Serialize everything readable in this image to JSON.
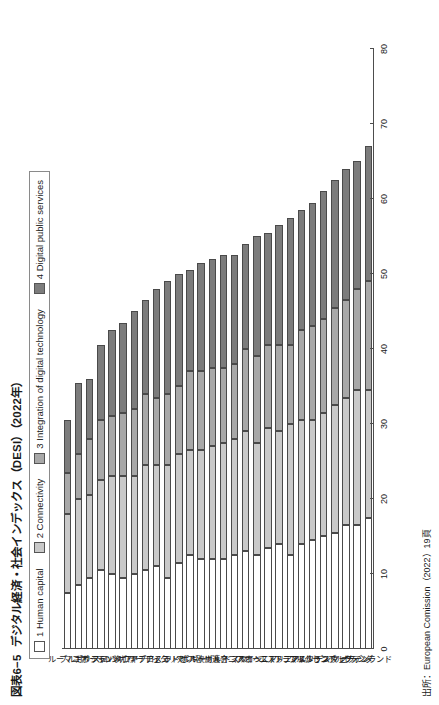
{
  "figure": {
    "title_number": "図表6−5",
    "title_text": "デジタル経済・社会インデックス（DESI）（2022年）",
    "source": "出所：European Comission（2022）19頁"
  },
  "legend": {
    "position": "top-left",
    "items": [
      {
        "label": "1 Human capital",
        "color": "#ffffff"
      },
      {
        "label": "2 Connectivity",
        "color": "#c9c9c9"
      },
      {
        "label": "3 Integration of digital technology",
        "color": "#a8a8a8"
      },
      {
        "label": "4 Digital public services",
        "color": "#7c7c7c"
      }
    ]
  },
  "chart_data": {
    "type": "bar",
    "orientation": "horizontal-stacked",
    "title": "デジタル経済・社会インデックス（DESI）（2022年）",
    "xlabel": "",
    "ylabel": "",
    "ylim": [
      0,
      80
    ],
    "ticks": [
      0,
      10,
      20,
      30,
      40,
      50,
      60,
      70,
      80
    ],
    "grid": false,
    "legend_position": "top-left",
    "categories": [
      "ルーマニア",
      "ブルガリア",
      "ギリシャ",
      "ポーランド",
      "スロバキア",
      "ハンガリー",
      "クロアチア",
      "キプロス",
      "チェコ",
      "イタリア",
      "ラトビア",
      "ベルギー",
      "ポルトガル",
      "欧州連合",
      "リトアニア",
      "ドイツ",
      "スペイン",
      "スロベニア",
      "オーストリア",
      "エストニア",
      "フランス",
      "マルタ",
      "アイルランド",
      "ルクセンブルク",
      "デンマーク",
      "スウェーデン",
      "オランダ",
      "フィンランド"
    ],
    "series": [
      {
        "name": "1 Human capital",
        "color": "#ffffff",
        "values": [
          7.5,
          8.5,
          9.5,
          10.5,
          10.0,
          9.5,
          10.0,
          10.5,
          11.0,
          9.5,
          11.5,
          12.5,
          12.0,
          12.0,
          12.0,
          12.5,
          13.0,
          12.5,
          13.5,
          14.0,
          12.5,
          14.0,
          14.5,
          15.0,
          15.5,
          16.5,
          16.5,
          17.5
        ]
      },
      {
        "name": "2 Connectivity",
        "color": "#c9c9c9",
        "values": [
          10.5,
          11.5,
          11.0,
          12.0,
          13.0,
          13.5,
          13.0,
          14.0,
          13.5,
          15.0,
          14.5,
          14.0,
          14.5,
          15.0,
          15.5,
          15.5,
          16.0,
          15.0,
          16.0,
          15.0,
          17.5,
          16.5,
          16.0,
          16.5,
          17.0,
          17.0,
          18.0,
          17.0
        ]
      },
      {
        "name": "3 Integration of digital technology",
        "color": "#a8a8a8",
        "values": [
          5.5,
          6.0,
          7.5,
          8.0,
          8.0,
          8.5,
          9.0,
          9.5,
          9.0,
          9.5,
          9.0,
          10.5,
          10.5,
          10.5,
          10.0,
          10.0,
          11.0,
          11.5,
          11.0,
          11.5,
          10.5,
          12.0,
          12.5,
          12.5,
          13.0,
          13.0,
          13.5,
          14.5
        ]
      },
      {
        "name": "4 Digital public services",
        "color": "#7c7c7c",
        "values": [
          7.0,
          9.5,
          8.0,
          10.0,
          11.5,
          12.0,
          13.0,
          12.5,
          14.5,
          15.0,
          15.0,
          13.5,
          14.5,
          14.5,
          15.0,
          14.5,
          14.0,
          16.0,
          15.0,
          16.0,
          17.0,
          16.0,
          16.5,
          17.0,
          17.0,
          17.5,
          17.0,
          18.0
        ]
      }
    ],
    "totals": [
      30.5,
      35.5,
      36.0,
      40.5,
      42.5,
      43.5,
      45.0,
      46.5,
      48.0,
      49.0,
      50.0,
      50.5,
      51.5,
      52.0,
      52.5,
      52.5,
      54.0,
      55.0,
      55.5,
      56.5,
      57.5,
      58.5,
      59.5,
      61.0,
      62.5,
      64.0,
      65.0,
      67.0
    ]
  }
}
